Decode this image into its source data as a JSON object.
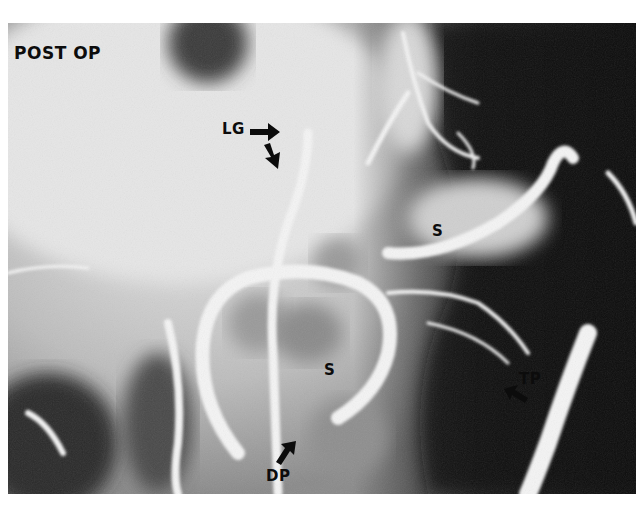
{
  "figure": {
    "caption_label": "POST OP",
    "annotations": [
      {
        "id": "lg",
        "text": "LG",
        "x": 222,
        "y": 122
      },
      {
        "id": "s-upper",
        "text": "S",
        "x": 432,
        "y": 224
      },
      {
        "id": "s-lower",
        "text": "S",
        "x": 324,
        "y": 363
      },
      {
        "id": "tp",
        "text": "TP",
        "x": 519,
        "y": 372
      },
      {
        "id": "dp",
        "text": "DP",
        "x": 266,
        "y": 469
      }
    ],
    "arrows": [
      {
        "id": "lg-arrow-right",
        "direction": "right"
      },
      {
        "id": "lg-arrow-down",
        "direction": "down-right"
      },
      {
        "id": "tp-arrow",
        "direction": "up-left"
      },
      {
        "id": "dp-arrow",
        "direction": "up-right"
      }
    ],
    "colors": {
      "label": "#0c0c0c",
      "background_light": "#d8d8d8",
      "background_dark": "#0a0a0a",
      "vessel": "#f0f0f0"
    }
  }
}
